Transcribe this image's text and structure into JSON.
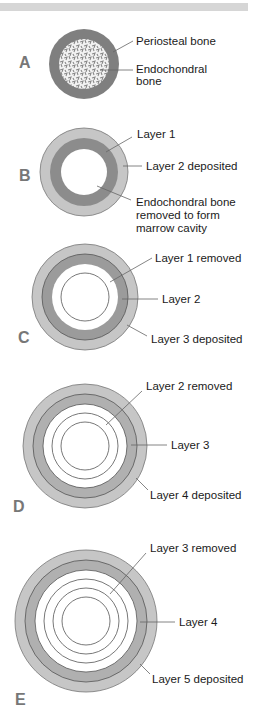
{
  "figure": {
    "colors": {
      "periosteal": "#7f7f7f",
      "dark_ring": "#8c8c8c",
      "light_ring": "#c6c6c6",
      "outline": "#555555",
      "leader": "#666666",
      "letter": "#777777",
      "topbar": "#d6d6d6"
    },
    "panels": [
      {
        "id": "A",
        "letter": "A",
        "labels": [
          "Periosteal bone",
          "Endochondral",
          "bone"
        ]
      },
      {
        "id": "B",
        "letter": "B",
        "labels": [
          "Layer 1",
          "Layer 2 deposited",
          "Endochondral bone",
          "removed to form",
          "marrow cavity"
        ]
      },
      {
        "id": "C",
        "letter": "C",
        "labels": [
          "Layer 1 removed",
          "Layer 2",
          "Layer 3 deposited"
        ]
      },
      {
        "id": "D",
        "letter": "D",
        "labels": [
          "Layer 2 removed",
          "Layer 3",
          "Layer 4 deposited"
        ]
      },
      {
        "id": "E",
        "letter": "E",
        "labels": [
          "Layer 3 removed",
          "Layer 4",
          "Layer 5 deposited"
        ]
      }
    ]
  }
}
